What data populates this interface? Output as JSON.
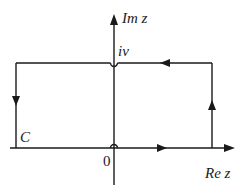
{
  "diagram": {
    "colors": {
      "stroke": "#1a1a1a",
      "background": "#ffffff"
    },
    "axes": {
      "imaginary_label": "Im z",
      "real_label": "Re z",
      "origin_label": "0"
    },
    "labels": {
      "top_point": "iν",
      "contour": "C"
    },
    "contour": {
      "shape": "rectangle",
      "direction": "counter-clockwise",
      "indentations": [
        "small semicircle above origin 0",
        "small semicircle below iν"
      ]
    }
  }
}
